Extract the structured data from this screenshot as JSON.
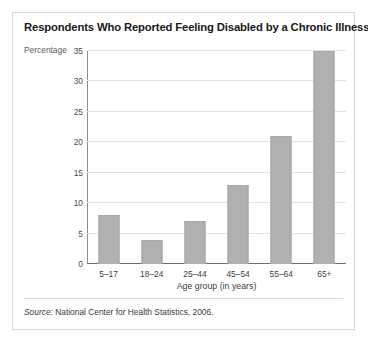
{
  "figure": {
    "title": "Respondents Who Reported Feeling Disabled by a Chronic Illness",
    "source_prefix": "Source:",
    "source_text": " National Center for Health Statistics, 2006."
  },
  "colors": {
    "bar_fill": "#b0b0b0",
    "bar_edge": "#a3a3a3",
    "gridline": "#e3e3e3",
    "axis": "#6e6e6e",
    "frame": "#d7d7d7",
    "text": "#231f20"
  },
  "chart_data": {
    "type": "bar",
    "title": "Respondents Who Reported Feeling Disabled by a Chronic Illness",
    "xlabel": "Age group (in years)",
    "ylabel": "Percentage",
    "categories": [
      "5–17",
      "18–24",
      "25–44",
      "45–54",
      "55–64",
      "65+"
    ],
    "values": [
      8,
      4,
      7,
      13,
      21,
      35
    ],
    "ylim": [
      0,
      35
    ],
    "yticks": [
      0,
      5,
      10,
      15,
      20,
      25,
      30,
      35
    ],
    "ytick_labels": [
      "0",
      "5",
      "10",
      "15",
      "20",
      "25",
      "30",
      "35"
    ],
    "grid": "horizontal",
    "legend": "none"
  }
}
